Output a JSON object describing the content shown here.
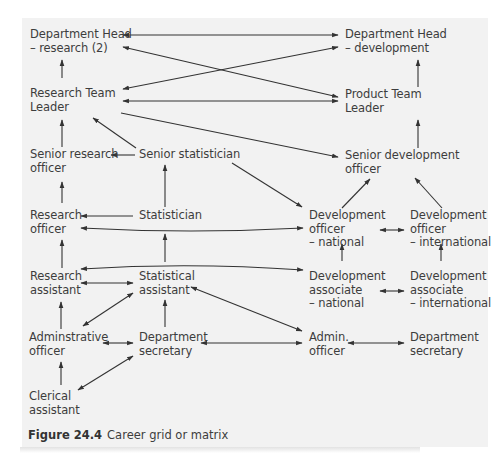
{
  "diagram": {
    "type": "career-grid",
    "background": "#f2f2f2",
    "line_color": "#333333",
    "nodes": {
      "dept_head_research": {
        "line1": "Department Head",
        "line2": "– research (2)",
        "line3": ""
      },
      "dept_head_development": {
        "line1": "Department Head",
        "line2": "– development",
        "line3": ""
      },
      "research_team_leader": {
        "line1": "Research Team",
        "line2": "Leader",
        "line3": ""
      },
      "product_team_leader": {
        "line1": "Product Team",
        "line2": "Leader",
        "line3": ""
      },
      "senior_research_officer": {
        "line1": "Senior research",
        "line2": "officer",
        "line3": ""
      },
      "senior_statistician": {
        "line1": "Senior statistician",
        "line2": "",
        "line3": ""
      },
      "senior_development_officer": {
        "line1": "Senior development",
        "line2": "officer",
        "line3": ""
      },
      "research_officer": {
        "line1": "Research",
        "line2": "officer",
        "line3": ""
      },
      "statistician": {
        "line1": "Statistician",
        "line2": "",
        "line3": ""
      },
      "development_officer_national": {
        "line1": "Development",
        "line2": "officer",
        "line3": "– national"
      },
      "development_officer_international": {
        "line1": "Development",
        "line2": "officer",
        "line3": "– international"
      },
      "research_assistant": {
        "line1": "Research",
        "line2": "assistant",
        "line3": ""
      },
      "statistical_assistant": {
        "line1": "Statistical",
        "line2": "assistant",
        "line3": ""
      },
      "development_associate_national": {
        "line1": "Development",
        "line2": "associate",
        "line3": "– national"
      },
      "development_associate_international": {
        "line1": "Development",
        "line2": "associate",
        "line3": "– international"
      },
      "administrative_officer": {
        "line1": "Adminstrative",
        "line2": "officer",
        "line3": ""
      },
      "department_secretary_1": {
        "line1": "Department",
        "line2": "secretary",
        "line3": ""
      },
      "admin_officer": {
        "line1": "Admin.",
        "line2": "officer",
        "line3": ""
      },
      "department_secretary_2": {
        "line1": "Department",
        "line2": "secretary",
        "line3": ""
      },
      "clerical_assistant": {
        "line1": "Clerical",
        "line2": "assistant",
        "line3": ""
      }
    },
    "edges": [
      {
        "from": "research_team_leader",
        "to": "dept_head_research",
        "type": "one-way"
      },
      {
        "from": "product_team_leader",
        "to": "dept_head_development",
        "type": "one-way"
      },
      {
        "from": "dept_head_research",
        "to": "dept_head_development",
        "type": "two-way"
      },
      {
        "from": "dept_head_research",
        "to": "product_team_leader",
        "type": "two-way"
      },
      {
        "from": "research_team_leader",
        "to": "dept_head_development",
        "type": "two-way"
      },
      {
        "from": "research_team_leader",
        "to": "product_team_leader",
        "type": "two-way"
      },
      {
        "from": "research_team_leader",
        "to": "senior_development_officer",
        "type": "one-way"
      },
      {
        "from": "senior_research_officer",
        "to": "research_team_leader",
        "type": "one-way"
      },
      {
        "from": "senior_statistician",
        "to": "research_team_leader",
        "type": "one-way"
      },
      {
        "from": "senior_statistician",
        "to": "senior_research_officer",
        "type": "one-way"
      },
      {
        "from": "senior_statistician",
        "to": "development_officer_national",
        "type": "one-way"
      },
      {
        "from": "senior_development_officer",
        "to": "product_team_leader",
        "type": "one-way"
      },
      {
        "from": "research_officer",
        "to": "senior_research_officer",
        "type": "one-way"
      },
      {
        "from": "statistician",
        "to": "senior_statistician",
        "type": "one-way"
      },
      {
        "from": "statistician",
        "to": "research_officer",
        "type": "one-way"
      },
      {
        "from": "research_officer",
        "to": "development_officer_national",
        "type": "two-way"
      },
      {
        "from": "development_officer_national",
        "to": "senior_development_officer",
        "type": "one-way"
      },
      {
        "from": "development_officer_international",
        "to": "senior_development_officer",
        "type": "one-way"
      },
      {
        "from": "development_officer_national",
        "to": "development_officer_international",
        "type": "two-way"
      },
      {
        "from": "research_assistant",
        "to": "research_officer",
        "type": "one-way"
      },
      {
        "from": "statistical_assistant",
        "to": "statistician",
        "type": "one-way"
      },
      {
        "from": "research_assistant",
        "to": "development_associate_national",
        "type": "two-way"
      },
      {
        "from": "research_assistant",
        "to": "statistical_assistant",
        "type": "two-way"
      },
      {
        "from": "development_associate_national",
        "to": "development_officer_national",
        "type": "one-way"
      },
      {
        "from": "development_associate_international",
        "to": "development_officer_international",
        "type": "one-way"
      },
      {
        "from": "development_associate_national",
        "to": "development_associate_international",
        "type": "two-way"
      },
      {
        "from": "statistical_assistant",
        "to": "admin_officer",
        "type": "two-way"
      },
      {
        "from": "administrative_officer",
        "to": "research_assistant",
        "type": "one-way"
      },
      {
        "from": "administrative_officer",
        "to": "statistical_assistant",
        "type": "two-way"
      },
      {
        "from": "department_secretary_1",
        "to": "statistical_assistant",
        "type": "one-way"
      },
      {
        "from": "administrative_officer",
        "to": "department_secretary_1",
        "type": "two-way"
      },
      {
        "from": "department_secretary_1",
        "to": "admin_officer",
        "type": "two-way"
      },
      {
        "from": "admin_officer",
        "to": "department_secretary_2",
        "type": "two-way"
      },
      {
        "from": "clerical_assistant",
        "to": "administrative_officer",
        "type": "one-way"
      },
      {
        "from": "clerical_assistant",
        "to": "department_secretary_1",
        "type": "two-way"
      }
    ]
  },
  "caption": {
    "label": "Figure 24.4",
    "text": "Career grid or matrix"
  }
}
